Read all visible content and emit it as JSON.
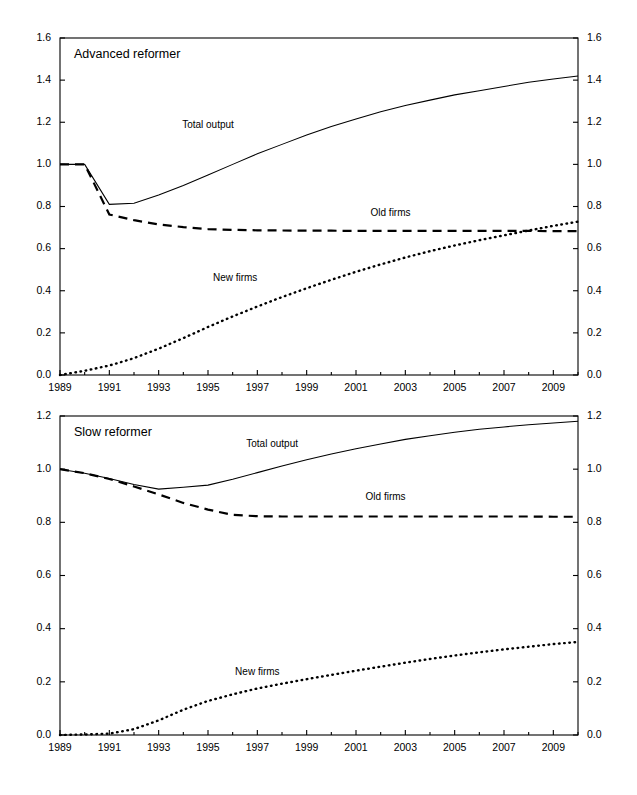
{
  "figure": {
    "background": "#ffffff",
    "line_color": "#000000"
  },
  "chart_data": [
    {
      "type": "line",
      "title": "Advanced reformer",
      "xlabel": "",
      "ylabel": "",
      "xlim": [
        1989,
        2010
      ],
      "ylim": [
        0.0,
        1.6
      ],
      "grid": false,
      "legend": "inline-labels",
      "xticks": [
        1989,
        1991,
        1993,
        1995,
        1997,
        1999,
        2001,
        2003,
        2005,
        2007,
        2009
      ],
      "xtick_labels": [
        "1989",
        "1991",
        "1993",
        "1995",
        "1997",
        "1999",
        "2001",
        "2003",
        "2005",
        "2007",
        "2009"
      ],
      "yticks": [
        0.0,
        0.2,
        0.4,
        0.6,
        0.8,
        1.0,
        1.2,
        1.4,
        1.6
      ],
      "ytick_labels": [
        "0.0",
        "0.2",
        "0.4",
        "0.6",
        "0.8",
        "1.0",
        "1.2",
        "1.4",
        "1.6"
      ],
      "right_axis_labels": [
        "0.0",
        "0.2",
        "0.4",
        "0.6",
        "0.8",
        "1.0",
        "1.2",
        "1.4",
        "1.6"
      ],
      "x": [
        1989,
        1990,
        1991,
        1992,
        1993,
        1994,
        1995,
        1996,
        1997,
        1998,
        1999,
        2000,
        2001,
        2002,
        2003,
        2004,
        2005,
        2006,
        2007,
        2008,
        2009,
        2010
      ],
      "series": [
        {
          "name": "Total output",
          "style": "solid",
          "label_x": 1995.0,
          "label_y": 1.175,
          "values": [
            1.0,
            1.0,
            0.81,
            0.815,
            0.855,
            0.9,
            0.95,
            1.0,
            1.05,
            1.095,
            1.14,
            1.18,
            1.215,
            1.25,
            1.28,
            1.305,
            1.33,
            1.35,
            1.37,
            1.39,
            1.405,
            1.42
          ]
        },
        {
          "name": "Old firms",
          "style": "dashed",
          "label_x": 2002.4,
          "label_y": 0.755,
          "values": [
            1.0,
            1.0,
            0.762,
            0.735,
            0.715,
            0.702,
            0.693,
            0.689,
            0.687,
            0.686,
            0.685,
            0.685,
            0.684,
            0.684,
            0.684,
            0.684,
            0.684,
            0.684,
            0.684,
            0.684,
            0.683,
            0.683
          ]
        },
        {
          "name": "New firms",
          "style": "dotted",
          "label_x": 1996.1,
          "label_y": 0.445,
          "values": [
            0.0,
            0.02,
            0.045,
            0.08,
            0.125,
            0.175,
            0.228,
            0.278,
            0.325,
            0.37,
            0.412,
            0.452,
            0.49,
            0.525,
            0.558,
            0.588,
            0.615,
            0.64,
            0.663,
            0.686,
            0.708,
            0.728
          ]
        }
      ]
    },
    {
      "type": "line",
      "title": "Slow reformer",
      "xlabel": "",
      "ylabel": "",
      "xlim": [
        1989,
        2010
      ],
      "ylim": [
        0.0,
        1.2
      ],
      "grid": false,
      "legend": "inline-labels",
      "xticks": [
        1989,
        1991,
        1993,
        1995,
        1997,
        1999,
        2001,
        2003,
        2005,
        2007,
        2009
      ],
      "xtick_labels": [
        "1989",
        "1991",
        "1993",
        "1995",
        "1997",
        "1999",
        "2001",
        "2003",
        "2005",
        "2007",
        "2009"
      ],
      "yticks": [
        0.0,
        0.2,
        0.4,
        0.6,
        0.8,
        1.0,
        1.2
      ],
      "ytick_labels": [
        "0.0",
        "0.2",
        "0.4",
        "0.6",
        "0.8",
        "1.0",
        "1.2"
      ],
      "right_axis_labels": [
        "0.0",
        "0.2",
        "0.4",
        "0.6",
        "0.8",
        "1.0",
        "1.2"
      ],
      "x": [
        1989,
        1990,
        1991,
        1992,
        1993,
        1994,
        1995,
        1996,
        1997,
        1998,
        1999,
        2000,
        2001,
        2002,
        2003,
        2004,
        2005,
        2006,
        2007,
        2008,
        2009,
        2010
      ],
      "series": [
        {
          "name": "Total output",
          "style": "solid",
          "label_x": 1997.6,
          "label_y": 1.085,
          "values": [
            1.0,
            0.985,
            0.965,
            0.942,
            0.925,
            0.932,
            0.94,
            0.962,
            0.987,
            1.012,
            1.035,
            1.057,
            1.077,
            1.095,
            1.112,
            1.126,
            1.139,
            1.15,
            1.159,
            1.167,
            1.174,
            1.18
          ]
        },
        {
          "name": "Old firms",
          "style": "dashed",
          "label_x": 2002.2,
          "label_y": 0.885,
          "values": [
            1.0,
            0.985,
            0.963,
            0.935,
            0.905,
            0.873,
            0.848,
            0.828,
            0.823,
            0.822,
            0.822,
            0.822,
            0.822,
            0.822,
            0.822,
            0.822,
            0.822,
            0.822,
            0.822,
            0.822,
            0.821,
            0.821
          ]
        },
        {
          "name": "New firms",
          "style": "dotted",
          "label_x": 1997.0,
          "label_y": 0.227,
          "values": [
            0.0,
            0.002,
            0.005,
            0.022,
            0.055,
            0.095,
            0.128,
            0.153,
            0.175,
            0.193,
            0.21,
            0.226,
            0.242,
            0.257,
            0.272,
            0.286,
            0.299,
            0.311,
            0.322,
            0.332,
            0.342,
            0.35
          ]
        }
      ]
    }
  ]
}
